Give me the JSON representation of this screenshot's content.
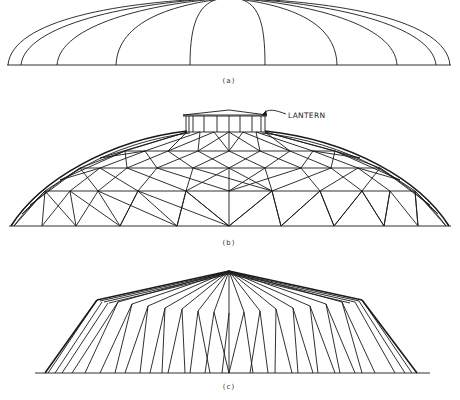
{
  "figure": {
    "panels": [
      {
        "id": "a",
        "label": "(a)",
        "description": "Elevation of dome with meridional ribs (arches) from crown to base ring"
      },
      {
        "id": "b",
        "label": "(b)",
        "description": "Geodesic/lattice dome with lantern at crown",
        "callout": "LANTERN"
      },
      {
        "id": "c",
        "label": "(c)",
        "description": "Folded-plate conical/pyramidal roof with radiating folds"
      }
    ],
    "panel_a": {
      "baseline_y": 65,
      "span": [
        7,
        451
      ],
      "rib_feet_x": [
        8,
        21,
        57,
        116,
        190,
        265,
        337,
        397,
        436,
        450
      ]
    },
    "panel_b": {
      "baseline_y": 226,
      "span": [
        9,
        451
      ],
      "rings_y": [
        132,
        151,
        168,
        191,
        226
      ],
      "lantern": {
        "x": [
          185,
          265
        ],
        "y_top": 110,
        "y_eave": 115,
        "y_base": 132
      }
    },
    "panel_c": {
      "apex": [
        229,
        271
      ],
      "eaves": [
        [
          97,
          300
        ],
        [
          362,
          300
        ]
      ],
      "baseline_y": 373,
      "base_span": [
        35,
        430
      ]
    },
    "caption": ""
  }
}
